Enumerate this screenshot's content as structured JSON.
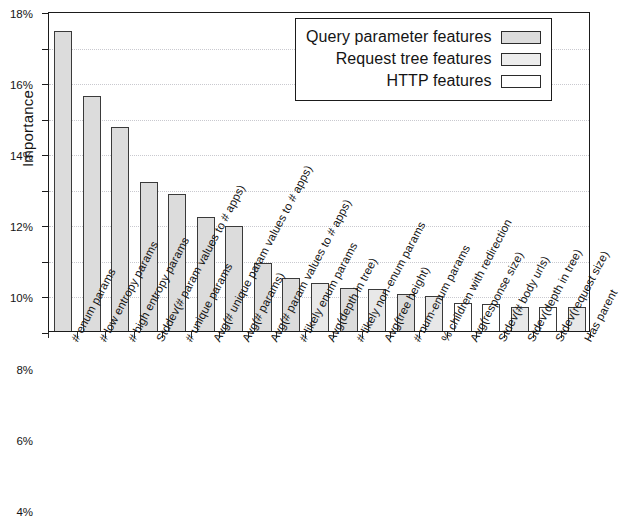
{
  "chart_data": {
    "type": "bar",
    "title": "",
    "xlabel": "",
    "ylabel": "Importance",
    "ylim": [
      0,
      18
    ],
    "ytick_labels": [
      "0%",
      "2%",
      "4%",
      "6%",
      "8%",
      "10%",
      "12%",
      "14%",
      "16%",
      "18%"
    ],
    "ytick_values": [
      0,
      2,
      4,
      6,
      8,
      10,
      12,
      14,
      16,
      18
    ],
    "grid": true,
    "value_unit": "%",
    "legend_position": "top-right",
    "legend": [
      {
        "label": "Query parameter features",
        "key": "query",
        "color": "#dcdcdc"
      },
      {
        "label": "Request tree features",
        "key": "tree",
        "color": "#ededed"
      },
      {
        "label": "HTTP features",
        "key": "http",
        "color": "#ffffff"
      }
    ],
    "categories": [
      "# enum params",
      "# low entropy params",
      "# high entropy params",
      "Stddev(# param values to # apps)",
      "# unique params",
      "Avg(# unique param values to # apps)",
      "Avg(# params)",
      "Avg(# param values to # apps)",
      "# likely enum params",
      "Avg(depth in tree)",
      "# likely non-enum params",
      "Avg(tree height)",
      "# num-enum params",
      "% children with redirection",
      "Avg(response size)",
      "Stdev(# body urls)",
      "Stdev(depth in tree)",
      "Stdev(request size)",
      "Has parent"
    ],
    "values": [
      16.9,
      13.2,
      11.5,
      8.4,
      7.7,
      6.4,
      5.9,
      3.8,
      3.0,
      2.7,
      2.4,
      2.35,
      2.1,
      1.95,
      1.6,
      1.5,
      1.35,
      1.35,
      1.35
    ],
    "series_keys": [
      "query",
      "query",
      "query",
      "query",
      "query",
      "query",
      "query",
      "query",
      "query",
      "tree",
      "query",
      "tree",
      "query",
      "tree",
      "http",
      "http",
      "tree",
      "http",
      "tree"
    ]
  }
}
